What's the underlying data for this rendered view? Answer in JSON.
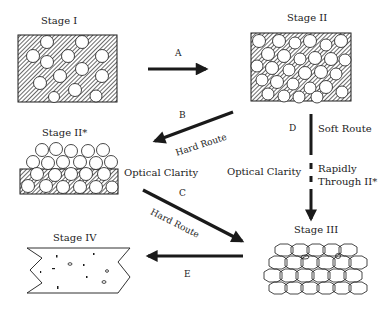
{
  "stages": {
    "stage1": {
      "title": "Stage I"
    },
    "stage2": {
      "title": "Stage II"
    },
    "stage2star": {
      "title": "Stage II*"
    },
    "stage3": {
      "title": "Stage III"
    },
    "stage4": {
      "title": "Stage IV"
    }
  },
  "arrows": {
    "a": {
      "label": "A"
    },
    "b": {
      "label": "B",
      "route": "Hard Route"
    },
    "c": {
      "label": "C",
      "route": "Hard Route"
    },
    "d": {
      "label": "D",
      "route": "Soft Route",
      "note_line1": "Rapidly",
      "note_line2": "Through II*"
    },
    "e": {
      "label": "E"
    }
  },
  "annotations": {
    "optical_clarity_left": "Optical Clarity",
    "optical_clarity_center": "Optical Clarity"
  },
  "colors": {
    "ink": "#1a1a1a",
    "hatch": "#555555",
    "background": "#ffffff"
  }
}
